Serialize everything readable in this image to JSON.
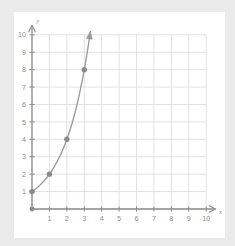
{
  "figure": {
    "background_color": "#eaeaea",
    "card_color": "#ffffff"
  },
  "chart_data": {
    "type": "line",
    "title": "",
    "subtitle": "",
    "xlabel": "x",
    "ylabel": "y",
    "xlim": [
      0,
      10
    ],
    "ylim": [
      0,
      10
    ],
    "grid": true,
    "grid_color": "#d9d9d9",
    "axis_color": "#8d8d8d",
    "curve_color": "#9a9a9a",
    "marker_color": "#8a8a8a",
    "legend": null,
    "legend_position": "none",
    "x_ticks": [
      1,
      2,
      3,
      4,
      5,
      6,
      7,
      8,
      9,
      10
    ],
    "y_ticks": [
      1,
      2,
      3,
      4,
      5,
      6,
      7,
      8,
      9,
      10
    ],
    "x_tick_labels": [
      "1",
      "2",
      "3",
      "4",
      "5",
      "6",
      "7",
      "8",
      "9",
      "10"
    ],
    "y_tick_labels": [
      "1",
      "2",
      "3",
      "4",
      "5",
      "6",
      "7",
      "8",
      "9",
      "10"
    ],
    "series": [
      {
        "name": "y = 2^x",
        "equation": "y = 2^x",
        "marked_points": [
          {
            "x": 0,
            "y": 1
          },
          {
            "x": 1,
            "y": 2
          },
          {
            "x": 2,
            "y": 4
          },
          {
            "x": 3,
            "y": 8
          }
        ],
        "curve_x_start": 0,
        "curve_x_end": 3.35,
        "has_end_arrow": true
      }
    ],
    "origin_marker": {
      "x": 0,
      "y": 0
    },
    "x_axis_arrow": true,
    "y_axis_arrow": true,
    "annotations": []
  }
}
